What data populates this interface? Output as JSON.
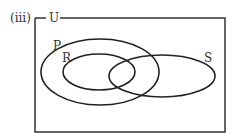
{
  "diagram": {
    "part_label": "(iii)",
    "universal_set": "U",
    "sets": [
      {
        "name": "P",
        "description": "large ellipse containing R"
      },
      {
        "name": "R",
        "description": "ellipse inside P"
      },
      {
        "name": "S",
        "description": "ellipse overlapping P and R"
      }
    ],
    "colors": {
      "stroke": "#222222",
      "text": "#333333",
      "background": "#ffffff"
    }
  }
}
